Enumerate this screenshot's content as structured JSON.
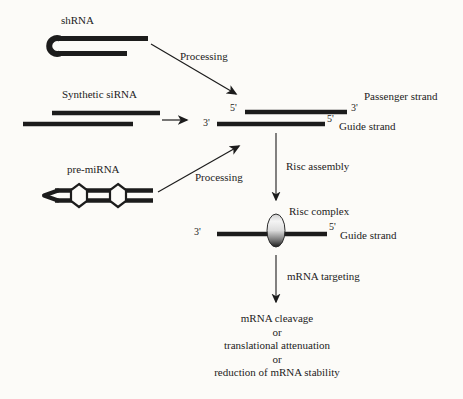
{
  "diagram": {
    "sources": {
      "shrna_label": "shRNA",
      "synthetic_sirna_label": "Synthetic siRNA",
      "pre_mirna_label": "pre-miRNA"
    },
    "arrows": {
      "processing_top": "Processing",
      "processing_bottom": "Processing",
      "risc_assembly": "Risc assembly",
      "mrna_targeting": "mRNA targeting"
    },
    "duplex": {
      "top_left_end": "5'",
      "top_right_end": "3'",
      "bottom_left_end": "3'",
      "bottom_right_end": "5'",
      "passenger_label": "Passenger strand",
      "guide_label": "Guide strand"
    },
    "risc": {
      "complex_label": "Risc complex",
      "left_end": "3'",
      "right_end": "5'",
      "guide_label": "Guide strand"
    },
    "outcomes": [
      "mRNA cleavage",
      "or",
      "translational attenuation",
      "or",
      "reduction of mRNA stability"
    ],
    "colors": {
      "background": "#fcfbf8",
      "ink": "#1c1c1c"
    }
  }
}
